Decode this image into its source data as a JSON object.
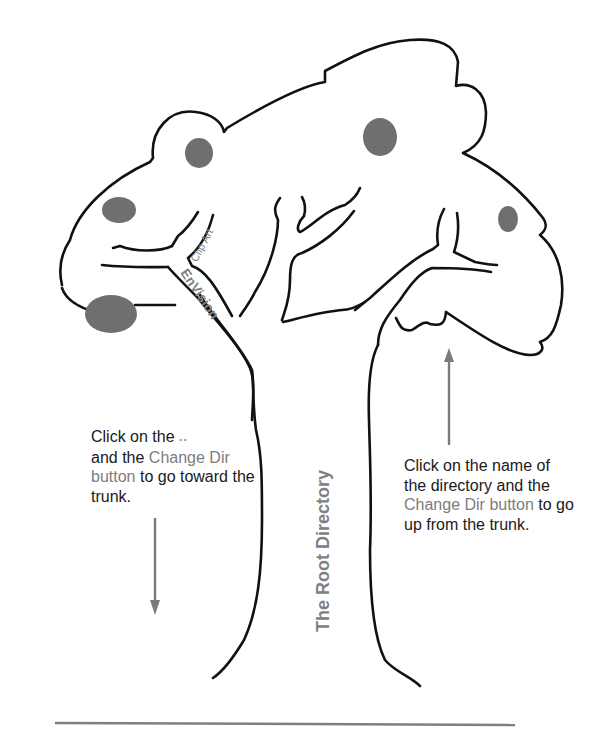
{
  "diagram": {
    "labels": {
      "trunk": "The Root Directory",
      "branch_main": "EnVision",
      "branch_sub": "Clip Art"
    },
    "left_caption": {
      "part1": "Click on the",
      "dots_icon": "..",
      "part2": "and the",
      "highlight": "Change Dir button",
      "part3": "to go toward the trunk."
    },
    "right_caption": {
      "part1": "Click on the name of the directory and the",
      "highlight": "Change Dir button",
      "part2": "to go up from the trunk."
    },
    "arrows": [
      {
        "name": "down-arrow",
        "direction": "down",
        "meaning": "toward the trunk"
      },
      {
        "name": "up-arrow",
        "direction": "up",
        "meaning": "up from the trunk"
      }
    ],
    "colors": {
      "outline": "#111111",
      "fruit": "#6f6f6f",
      "highlight_text": "#7d7d7d",
      "arrow": "#7a7a7a",
      "baseline": "#7f7f7f"
    }
  }
}
